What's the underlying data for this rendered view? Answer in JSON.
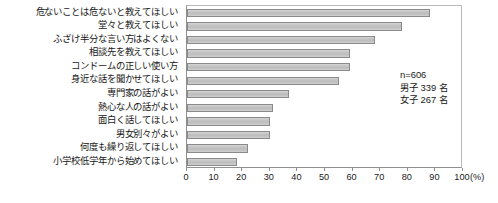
{
  "chart_data": {
    "type": "bar",
    "orientation": "horizontal",
    "title": "",
    "xlabel": "(%)",
    "ylabel": "",
    "xlim": [
      0,
      100
    ],
    "grid": false,
    "legend": null,
    "tick_labels": [
      "0",
      "10",
      "20",
      "30",
      "40",
      "50",
      "60",
      "70",
      "80",
      "90",
      "100"
    ],
    "tick_values": [
      0,
      10,
      20,
      30,
      40,
      50,
      60,
      70,
      80,
      90,
      100
    ],
    "unit": "(%)",
    "categories": [
      "危ないことは危ないと教えてほしい",
      "堂々と教えてほしい",
      "ふざけ半分な言い方はよくない",
      "相談先を教えてほしい",
      "コンドームの正しい使い方",
      "身近な話を聞かせてほしい",
      "専門家の話がよい",
      "熱心な人の話がよい",
      "面白く話してほしい",
      "男女別々がよい",
      "何度も繰り返してほしい",
      "小学校低学年から始めてほしい"
    ],
    "values": [
      88,
      78,
      68,
      59,
      59,
      55,
      37,
      31,
      30,
      30,
      22,
      18
    ],
    "annotations": {
      "n_total": "n=606",
      "male": "男子 339 名",
      "female": "女子 267 名"
    },
    "colors": {
      "bar_fill": "#c4c4c4",
      "bar_border": "#8a8a8a",
      "axis": "#8f8f8f",
      "text": "#181818"
    }
  }
}
